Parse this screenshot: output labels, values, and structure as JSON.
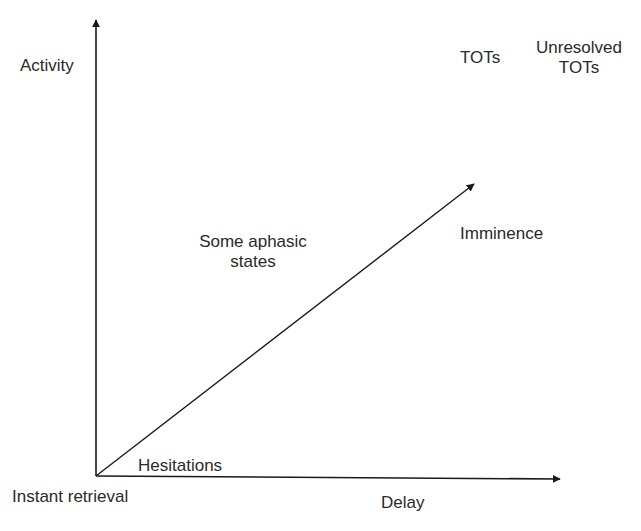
{
  "diagram": {
    "type": "axis-diagram",
    "axes": {
      "y_label": "Activity",
      "x_label": "Delay",
      "origin_label": "Instant retrieval"
    },
    "labels": {
      "hesitations": "Hesitations",
      "aphasic_line1": "Some aphasic",
      "aphasic_line2": "states",
      "imminence": "Imminence",
      "tots": "TOTs",
      "unresolved_line1": "Unresolved",
      "unresolved_line2": "TOTs"
    },
    "arrows": [
      {
        "name": "y-axis",
        "from": [
          96,
          476
        ],
        "to": [
          96,
          18
        ]
      },
      {
        "name": "x-axis",
        "from": [
          96,
          476
        ],
        "to": [
          562,
          479
        ]
      },
      {
        "name": "diagonal",
        "from": [
          96,
          476
        ],
        "to": [
          476,
          182
        ]
      }
    ],
    "colors": {
      "line": "#1a1a1a",
      "text": "#2a2a2a",
      "background": "#ffffff"
    }
  }
}
